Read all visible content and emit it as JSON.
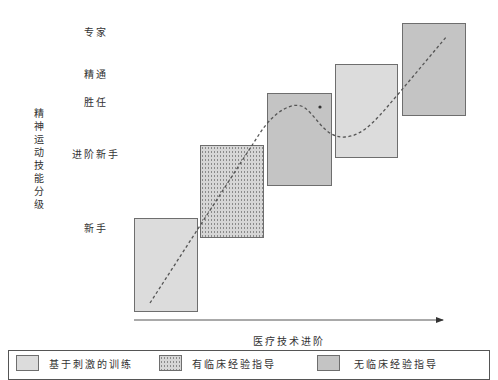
{
  "diagram": {
    "y_axis": {
      "title": "精神运动技能分级",
      "levels": [
        {
          "label": "专家",
          "top": 24,
          "left": 84
        },
        {
          "label": "精通",
          "top": 66,
          "left": 84
        },
        {
          "label": "胜任",
          "top": 94,
          "left": 84
        },
        {
          "label": "进阶新手",
          "top": 146,
          "left": 72
        },
        {
          "label": "新手",
          "top": 220,
          "left": 84
        }
      ]
    },
    "x_axis": {
      "title": "医疗技术进阶"
    },
    "stages": [
      {
        "type": "light",
        "legend": "基于刺激的训练",
        "x": 134,
        "y": 218,
        "w": 64,
        "h": 94
      },
      {
        "type": "dotted",
        "legend": "有临床经验指导",
        "x": 200,
        "y": 145,
        "w": 64,
        "h": 93
      },
      {
        "type": "dark",
        "legend": "无临床经验指导",
        "x": 267,
        "y": 93,
        "w": 65,
        "h": 93
      },
      {
        "type": "light",
        "legend": "基于刺激的训练",
        "x": 335,
        "y": 64,
        "w": 63,
        "h": 94
      },
      {
        "type": "dark",
        "legend": "无临床经验指导",
        "x": 402,
        "y": 23,
        "w": 64,
        "h": 93
      }
    ],
    "marker": {
      "label": "*",
      "x": 319,
      "y": 107
    }
  },
  "legend": {
    "items": [
      {
        "label": "基于刺激的训练",
        "pattern": "light"
      },
      {
        "label": "有临床经验指导",
        "pattern": "dotted"
      },
      {
        "label": "无临床经验指导",
        "pattern": "dark"
      }
    ]
  },
  "colors": {
    "light_fill": "#dcdcdc",
    "dark_fill": "#c4c4c4",
    "border": "#6e6e6e",
    "curve": "#555555"
  }
}
